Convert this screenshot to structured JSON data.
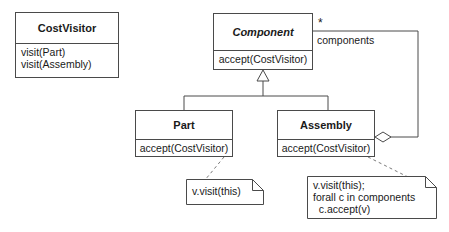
{
  "diagram": {
    "kind": "uml-class-diagram",
    "stroke_color": "#4a4a4a",
    "text_color": "#1a1a1a",
    "background_color": "#ffffff"
  },
  "classes": {
    "cost_visitor": {
      "name": "CostVisitor",
      "abstract": false,
      "operations": [
        "visit(Part)",
        "visit(Assembly)"
      ]
    },
    "component": {
      "name": "Component",
      "abstract": true,
      "operations": [
        "accept(CostVisitor)"
      ]
    },
    "part": {
      "name": "Part",
      "abstract": false,
      "operations": [
        "accept(CostVisitor)"
      ]
    },
    "assembly": {
      "name": "Assembly",
      "abstract": false,
      "operations": [
        "accept(CostVisitor)"
      ]
    }
  },
  "association": {
    "role_label": "components",
    "multiplicity": "*",
    "type": "aggregation",
    "from": "Assembly",
    "to": "Component"
  },
  "generalization": {
    "parent": "Component",
    "children": [
      "Part",
      "Assembly"
    ]
  },
  "notes": {
    "part_note": {
      "lines": [
        "v.visit(this)"
      ],
      "attached_to": "Part.accept(CostVisitor)"
    },
    "assembly_note": {
      "lines": [
        "v.visit(this);",
        "forall c in components",
        "  c.accept(v)"
      ],
      "attached_to": "Assembly.accept(CostVisitor)"
    }
  }
}
